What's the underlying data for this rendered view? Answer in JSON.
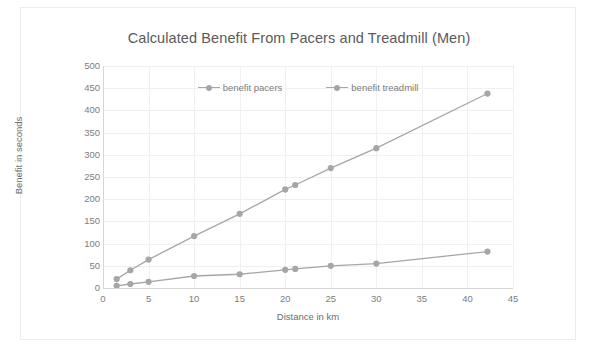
{
  "chart_data": {
    "type": "line",
    "title": "Calculated Benefit From Pacers and Treadmill (Men)",
    "xlabel": "Distance in km",
    "ylabel": "Benefit in seconds",
    "xlim": [
      0,
      45
    ],
    "ylim": [
      0,
      500
    ],
    "xticks": [
      0,
      5,
      10,
      15,
      20,
      25,
      30,
      35,
      40,
      45
    ],
    "yticks": [
      0,
      50,
      100,
      150,
      200,
      250,
      300,
      350,
      400,
      450,
      500
    ],
    "grid": true,
    "legend_position": "top-center",
    "series": [
      {
        "name": "benefit pacers",
        "color": "#a6a6a6",
        "x": [
          1.5,
          3,
          5,
          10,
          15,
          20,
          21.1,
          25,
          30,
          42.2
        ],
        "y": [
          20,
          40,
          64,
          117,
          167,
          222,
          232,
          270,
          315,
          438
        ]
      },
      {
        "name": "benefit treadmill",
        "color": "#a6a6a6",
        "x": [
          1.5,
          3,
          5,
          10,
          15,
          20,
          21.1,
          25,
          30,
          42.2
        ],
        "y": [
          5,
          9,
          14,
          27,
          31,
          41,
          43,
          50,
          55,
          82
        ]
      }
    ]
  }
}
